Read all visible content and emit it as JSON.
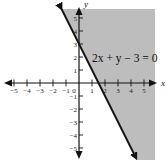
{
  "chart_data": {
    "type": "line",
    "title": "",
    "xlabel": "x",
    "ylabel": "y",
    "xlim": [
      -5.7,
      5.7
    ],
    "ylim": [
      -5.7,
      5.7
    ],
    "x_ticks": [
      -5,
      -4,
      -3,
      -2,
      -1,
      0,
      1,
      2,
      3,
      4,
      5
    ],
    "y_ticks": [
      -5,
      -4,
      -3,
      -2,
      -1,
      1,
      2,
      3,
      4,
      5
    ],
    "x_tick_labels": [
      "−5",
      "−4",
      "−3",
      "−2",
      "−1",
      "0",
      "1",
      "2",
      "3",
      "4",
      "5"
    ],
    "y_tick_labels": [
      "−5",
      "−4",
      "−3",
      "−2",
      "−1",
      "1",
      "2",
      "3",
      "4",
      "5"
    ],
    "grid": false,
    "series": [
      {
        "name": "2x + y − 3 = 0",
        "equation": "y = -2x + 3",
        "x": [
          -1.35,
          0,
          1.5,
          4.4
        ],
        "y": [
          5.7,
          3,
          0,
          -5.8
        ],
        "style": "solid",
        "color": "#111111"
      }
    ],
    "shaded_region": {
      "description": "half-plane to the right of the line",
      "inequality": "2x + y − 3 ≥ 0",
      "color": "#bdbdbd"
    },
    "annotations": [
      {
        "text": "2x + y − 3 = 0",
        "x": 2.7,
        "y": 2
      }
    ]
  },
  "labels": {
    "x_axis": "x",
    "y_axis": "y",
    "equation": "2x + y − 3 = 0"
  }
}
